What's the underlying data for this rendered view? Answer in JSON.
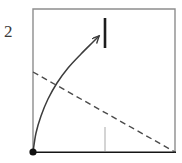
{
  "figure": {
    "label": "2",
    "label_position": {
      "x": 4,
      "y": 22
    },
    "canvas": {
      "width": 182,
      "height": 163,
      "background": "#ffffff"
    }
  },
  "plot_frame": {
    "name": "plot-box",
    "left": 33,
    "top": 9,
    "right": 175,
    "bottom": 152,
    "border_color": "#8d8d8d",
    "border_width": 1.4,
    "axis_color": "#151515",
    "axis_width": 1.6,
    "fill": "#ffffff"
  },
  "chart_data": {
    "type": "line",
    "title": "",
    "xlabel": "",
    "ylabel": "",
    "xlim": [
      33,
      175
    ],
    "ylim": [
      152,
      9
    ],
    "grid": false,
    "legend": null,
    "series": [
      {
        "name": "rising-curve",
        "role": "solid concave-down curve with arrowhead",
        "style": "solid",
        "color": "#3c3c3c",
        "width": 1.5,
        "arrowhead": true,
        "points": [
          {
            "x": 33,
            "y": 152
          },
          {
            "x": 36,
            "y": 133
          },
          {
            "x": 41,
            "y": 116
          },
          {
            "x": 48,
            "y": 99
          },
          {
            "x": 57,
            "y": 83
          },
          {
            "x": 68,
            "y": 68
          },
          {
            "x": 81,
            "y": 54
          },
          {
            "x": 93,
            "y": 42
          },
          {
            "x": 99,
            "y": 36
          }
        ],
        "arrow_tip": {
          "x": 99,
          "y": 36
        },
        "arrow_from": {
          "x": 93,
          "y": 42
        }
      },
      {
        "name": "falling-dashed-line",
        "role": "dashed descending straight line",
        "style": "dashed",
        "dash_pattern": "6 4",
        "color": "#4a4a4a",
        "width": 1.4,
        "points": [
          {
            "x": 33,
            "y": 72
          },
          {
            "x": 175,
            "y": 152
          }
        ]
      }
    ],
    "markers": [
      {
        "name": "origin-dot",
        "shape": "filled-circle",
        "x": 33,
        "y": 152,
        "radius": 3.6,
        "color": "#111111"
      }
    ],
    "annotations": [
      {
        "name": "upper-tick",
        "shape": "vertical-segment",
        "x": 105,
        "y_top": 18,
        "y_bottom": 48,
        "color": "#1d1d1d",
        "width": 2.6
      },
      {
        "name": "lower-tick",
        "shape": "vertical-segment",
        "x": 105,
        "y_top": 127,
        "y_bottom": 151,
        "color": "#a9a9a9",
        "width": 1.0
      }
    ]
  }
}
